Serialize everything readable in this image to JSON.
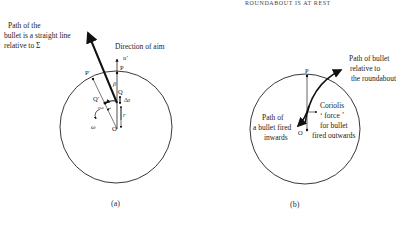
{
  "header": {
    "text": "ROUNDABOUT IS AT REST"
  },
  "figure_a": {
    "caption": "(a)",
    "bullet_path_label": [
      "Path of the",
      "bullet is a straight line",
      "relative to Σ"
    ],
    "direction_label": "Direction of aim",
    "point_labels": {
      "P": "P",
      "P_prime": "P′",
      "Q": "Q",
      "Q_prime": "Q′",
      "O": "O"
    },
    "symbols": {
      "u_prime": "u′",
      "beta": "β",
      "delta_r": "Δr",
      "r": "r",
      "r_omega": "rω",
      "omega": "ω"
    }
  },
  "figure_b": {
    "caption": "(b)",
    "relative_path_label": [
      "Path of bullet",
      "relative to",
      "the roundabout"
    ],
    "inward_label": [
      "Path of",
      "a bullet fired",
      "inwards"
    ],
    "coriolis_label": [
      "Coriolis",
      "‘ force ’",
      "for bullet",
      "fired outwards"
    ],
    "point_labels": {
      "P": "P",
      "O": "O"
    }
  }
}
